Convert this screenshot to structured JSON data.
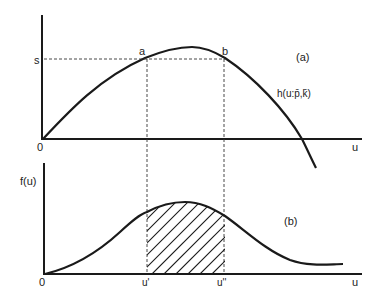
{
  "panel_a": {
    "panel_label": "(a)",
    "curve_label": "h(u:p̄,k̄)",
    "y_level_label": "s",
    "point_a_label": "a",
    "point_b_label": "b",
    "origin_label": "0",
    "x_axis_label": "u"
  },
  "panel_b": {
    "panel_label": "(b)",
    "y_axis_label": "f(u)",
    "origin_label": "0",
    "x_axis_label": "u",
    "u_prime_label": "u'",
    "u_double_prime_label": "u''"
  }
}
